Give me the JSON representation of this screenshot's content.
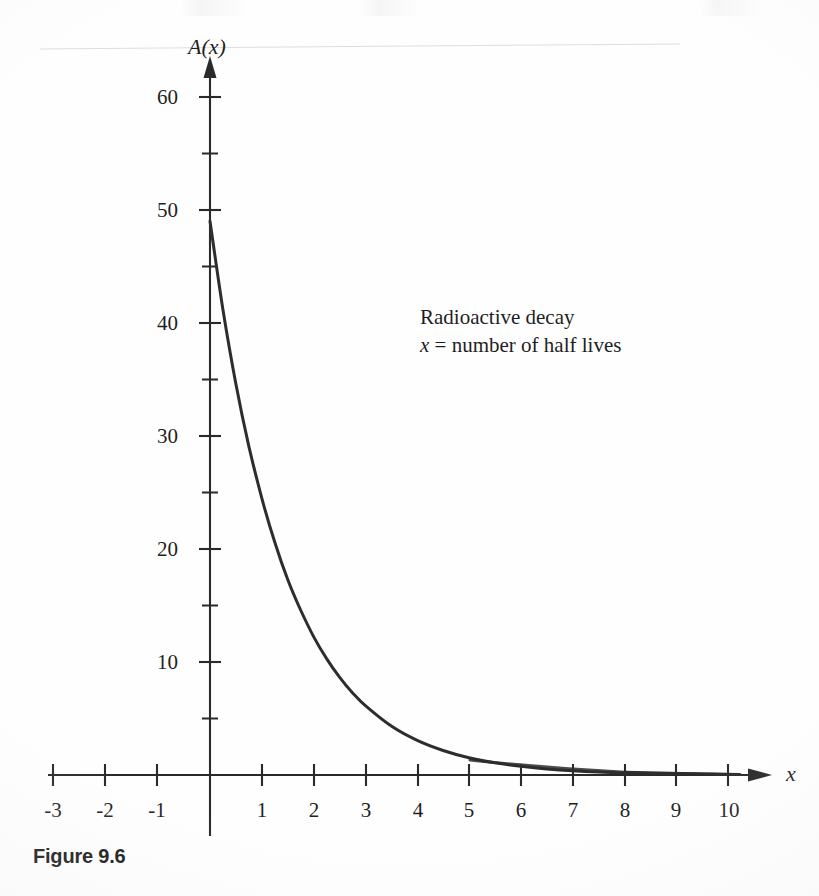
{
  "figure": {
    "caption": "Figure 9.6"
  },
  "axes": {
    "y_axis_name": "A(x)",
    "x_axis_name": "x",
    "x_ticks": [
      "-3",
      "-2",
      "-1",
      "1",
      "2",
      "3",
      "4",
      "5",
      "6",
      "7",
      "8",
      "9",
      "10"
    ],
    "y_ticks": [
      "10",
      "20",
      "30",
      "40",
      "50",
      "60"
    ]
  },
  "annotation": {
    "line1": "Radioactive decay",
    "line2_var": "x",
    "line2_rest": " = number of half lives"
  },
  "colors": {
    "ink": "#2a2a2a",
    "curve": "#2d2d2d",
    "page": "#fefefe"
  },
  "chart_data": {
    "type": "line",
    "title": "",
    "subtitle": "",
    "xlabel": "x",
    "ylabel": "A(x)",
    "annotations": [
      "Radioactive decay",
      "x = number of half lives"
    ],
    "grid": false,
    "legend": "none",
    "xlim": [
      -3,
      10.6
    ],
    "ylim": [
      0,
      62
    ],
    "x_tick_values": [
      -3,
      -2,
      -1,
      1,
      2,
      3,
      4,
      5,
      6,
      7,
      8,
      9,
      10
    ],
    "y_tick_values": [
      10,
      20,
      30,
      40,
      50,
      60
    ],
    "y_minor_tick_values": [
      5,
      15,
      25,
      35,
      45,
      55
    ],
    "series": [
      {
        "name": "A(x) = 49(1/2)^x",
        "x": [
          0,
          0.25,
          0.5,
          0.75,
          1,
          1.25,
          1.5,
          1.75,
          2,
          2.25,
          2.5,
          2.75,
          3,
          3.5,
          4,
          4.5,
          5,
          5.5,
          6,
          6.5,
          7,
          7.5,
          8,
          8.5,
          9,
          9.5,
          10
        ],
        "values": [
          49,
          41.2,
          34.6,
          29.1,
          24.5,
          20.6,
          17.3,
          14.6,
          12.25,
          10.3,
          8.66,
          7.28,
          6.13,
          4.33,
          3.06,
          2.17,
          1.53,
          1.08,
          0.77,
          0.54,
          0.38,
          0.27,
          0.19,
          0.14,
          0.096,
          0.068,
          0.048
        ]
      }
    ]
  }
}
